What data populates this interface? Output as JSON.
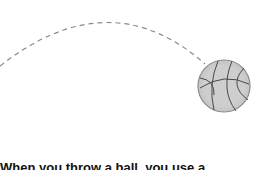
{
  "illustration": {
    "subject": "basketball-trajectory",
    "arc_color": "#8a8a8a",
    "ball_fill": "#c8c8c8",
    "ball_stroke": "#7a7a7a",
    "ball_seam_color": "#3a3a3a"
  },
  "caption": {
    "text": "When you throw a ball, you use a"
  }
}
